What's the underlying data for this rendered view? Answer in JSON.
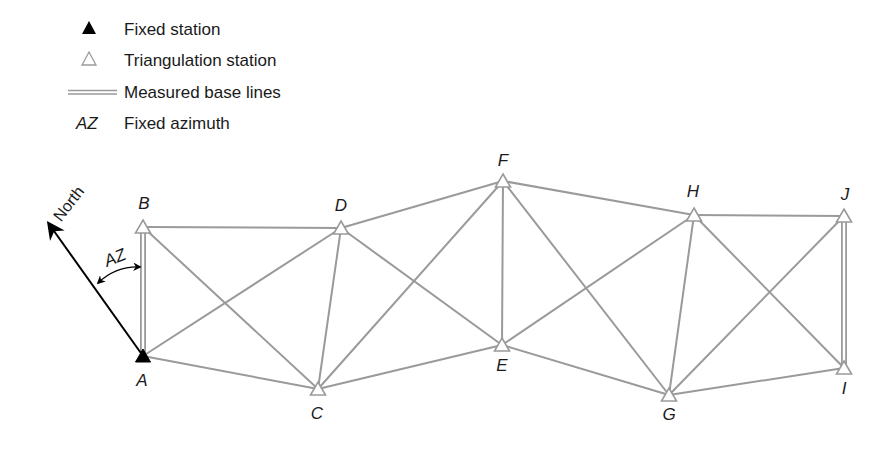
{
  "legend": {
    "items": [
      {
        "symbol": "filled-triangle",
        "label": "Fixed station"
      },
      {
        "symbol": "hollow-triangle",
        "label": "Triangulation station"
      },
      {
        "symbol": "double-line",
        "label": "Measured base lines"
      },
      {
        "symbol": "AZ",
        "label": "Fixed azimuth"
      }
    ]
  },
  "north_label": "North",
  "azimuth_label": "AZ",
  "colors": {
    "line": "#9a9a9a",
    "fixed_station": "#000000",
    "text": "#1a1a1a"
  },
  "stations": [
    {
      "id": "A",
      "type": "fixed",
      "x": 143,
      "y": 356,
      "label_x": 142,
      "label_y": 386
    },
    {
      "id": "B",
      "type": "triangulation",
      "x": 143,
      "y": 227,
      "label_x": 144,
      "label_y": 209
    },
    {
      "id": "C",
      "type": "triangulation",
      "x": 318,
      "y": 389,
      "label_x": 317,
      "label_y": 419
    },
    {
      "id": "D",
      "type": "triangulation",
      "x": 341,
      "y": 228,
      "label_x": 341,
      "label_y": 211
    },
    {
      "id": "E",
      "type": "triangulation",
      "x": 502,
      "y": 345,
      "label_x": 502,
      "label_y": 371
    },
    {
      "id": "F",
      "type": "triangulation",
      "x": 503,
      "y": 181,
      "label_x": 503,
      "label_y": 166
    },
    {
      "id": "G",
      "type": "triangulation",
      "x": 669,
      "y": 395,
      "label_x": 669,
      "label_y": 420
    },
    {
      "id": "H",
      "type": "triangulation",
      "x": 694,
      "y": 215,
      "label_x": 693,
      "label_y": 197
    },
    {
      "id": "I",
      "type": "triangulation",
      "x": 844,
      "y": 368,
      "label_x": 844,
      "label_y": 394
    },
    {
      "id": "J",
      "type": "triangulation",
      "x": 844,
      "y": 216,
      "label_x": 845,
      "label_y": 200
    }
  ],
  "edges": [
    [
      "A",
      "D"
    ],
    [
      "A",
      "C"
    ],
    [
      "B",
      "D"
    ],
    [
      "B",
      "C"
    ],
    [
      "D",
      "C"
    ],
    [
      "D",
      "F"
    ],
    [
      "D",
      "E"
    ],
    [
      "C",
      "F"
    ],
    [
      "C",
      "E"
    ],
    [
      "F",
      "E"
    ],
    [
      "F",
      "H"
    ],
    [
      "F",
      "G"
    ],
    [
      "E",
      "H"
    ],
    [
      "E",
      "G"
    ],
    [
      "H",
      "J"
    ],
    [
      "H",
      "G"
    ],
    [
      "H",
      "I"
    ],
    [
      "G",
      "J"
    ],
    [
      "G",
      "I"
    ]
  ],
  "base_lines": [
    [
      "A",
      "B"
    ],
    [
      "J",
      "I"
    ]
  ]
}
